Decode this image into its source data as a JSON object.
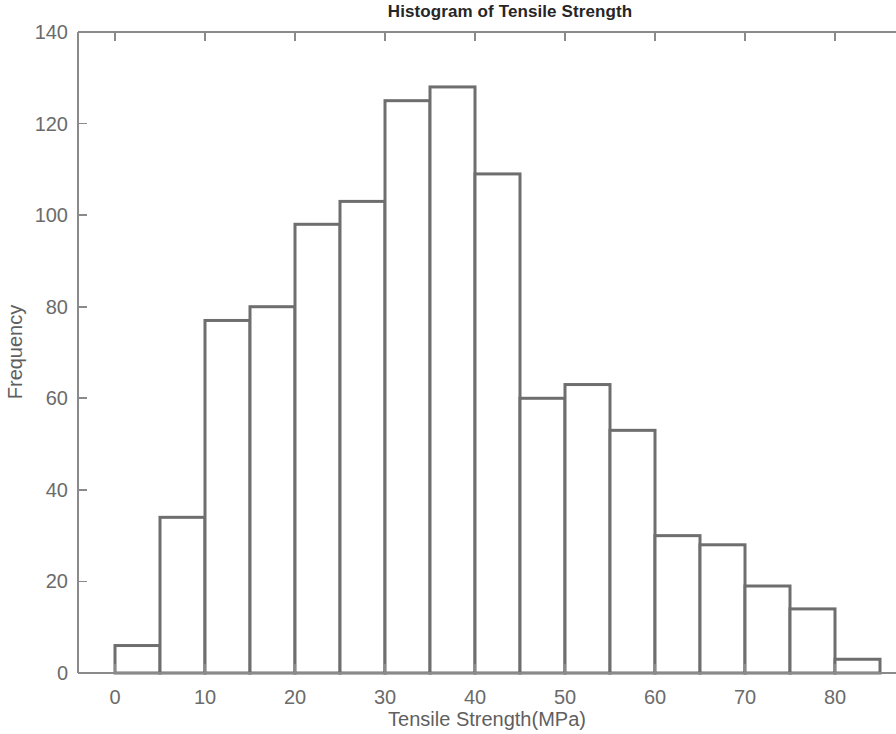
{
  "chart_data": {
    "type": "bar",
    "title": "Histogram of Tensile Strength",
    "xlabel": "Tensile Strength(MPa)",
    "ylabel": "Frequency",
    "grid": false,
    "legend": null,
    "xlim": [
      -1.5,
      90
    ],
    "ylim": [
      0,
      140
    ],
    "xticks": [
      0,
      10,
      20,
      30,
      40,
      50,
      60,
      70,
      80
    ],
    "xtick_labels": [
      "0",
      "10",
      "20",
      "30",
      "40",
      "50",
      "60",
      "70",
      "80"
    ],
    "yticks": [
      0,
      20,
      40,
      60,
      80,
      100,
      120,
      140
    ],
    "ytick_labels": [
      "0",
      "20",
      "40",
      "60",
      "80",
      "100",
      "120",
      "140"
    ],
    "bin_width": 5,
    "bin_edges": [
      0,
      5,
      10,
      15,
      20,
      25,
      30,
      35,
      40,
      45,
      50,
      55,
      60,
      65,
      70,
      75,
      80,
      85
    ],
    "categories": [
      "0-5",
      "5-10",
      "10-15",
      "15-20",
      "20-25",
      "25-30",
      "30-35",
      "35-40",
      "40-45",
      "45-50",
      "50-55",
      "55-60",
      "60-65",
      "65-70",
      "70-75",
      "75-80",
      "80-85"
    ],
    "values": [
      6,
      34,
      77,
      80,
      98,
      103,
      125,
      128,
      109,
      60,
      63,
      53,
      30,
      28,
      19,
      14,
      3
    ],
    "bar_fill_color": "#ffffff",
    "bar_edge_color": "#6e6e6e",
    "axis_color": "#8a8a8a",
    "text_color": "#6b6b6b",
    "title_color": "#262626",
    "background_color": "#ffffff"
  }
}
